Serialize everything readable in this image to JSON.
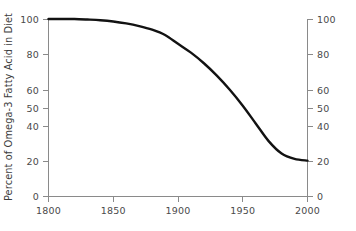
{
  "chart_data": {
    "type": "line",
    "title": "",
    "xlabel": "",
    "ylabel": "Percent of Omega-3 Fatty Acid in Diet",
    "ylabel_right": "",
    "xlim": [
      1800,
      2000
    ],
    "ylim": [
      0,
      100
    ],
    "grid": false,
    "legend": "none",
    "xticks": [
      1800,
      1850,
      1900,
      1950,
      2000
    ],
    "xtick_labels": [
      "1800",
      "1850",
      "1900",
      "1950",
      "2000"
    ],
    "yticks": [
      0,
      20,
      40,
      50,
      60,
      80,
      100
    ],
    "ytick_labels": [
      "0",
      "20",
      "40",
      "50",
      "60",
      "80",
      "100"
    ],
    "yticks_right": [
      0,
      20,
      40,
      50,
      60,
      80,
      100
    ],
    "ytick_labels_right": [
      "0",
      "20",
      "40",
      "50",
      "60",
      "80",
      "100"
    ],
    "series": [
      {
        "name": "Percent of Omega-3 Fatty Acid in Diet",
        "color": "#121212",
        "x": [
          1800,
          1810,
          1820,
          1830,
          1840,
          1850,
          1860,
          1870,
          1880,
          1890,
          1900,
          1910,
          1920,
          1930,
          1940,
          1950,
          1960,
          1970,
          1980,
          1990,
          2000
        ],
        "values": [
          100,
          100,
          100,
          99.7,
          99.3,
          98.6,
          97.5,
          96,
          94,
          91,
          86,
          81,
          75,
          68,
          60,
          51,
          41,
          31,
          24,
          21,
          20
        ]
      }
    ]
  },
  "axis_labels": {
    "y_left": [
      "100",
      "80",
      "60",
      "50",
      "40",
      "20",
      "0"
    ],
    "y_right": [
      "100",
      "80",
      "60",
      "50",
      "40",
      "20",
      "0"
    ],
    "x": [
      "1800",
      "1850",
      "1900",
      "1950",
      "2000"
    ]
  },
  "colors": {
    "curve": "#121212",
    "axis": "#8a8a8a",
    "text": "#4a4a4a",
    "background": "#ffffff"
  }
}
